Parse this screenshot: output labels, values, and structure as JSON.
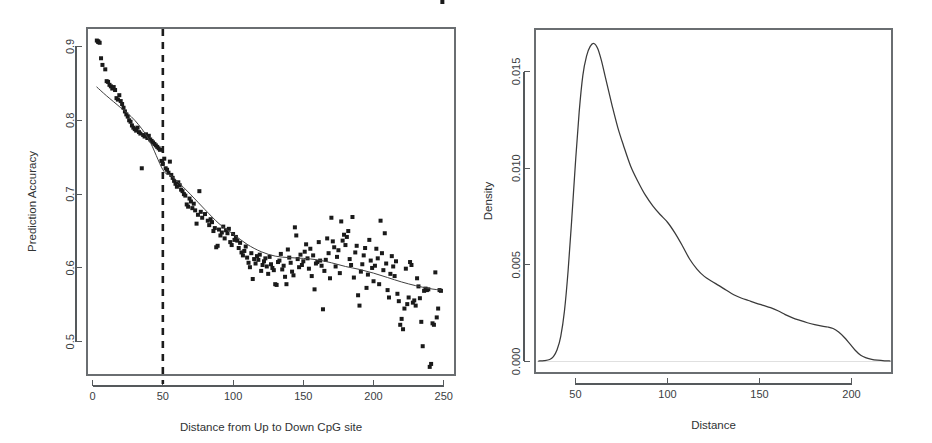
{
  "figure": {
    "background": "#ffffff",
    "point_color": "#1a1a1a",
    "line_color": "#404040",
    "axis_color": "#55595c"
  },
  "chart_data": [
    {
      "type": "scatter",
      "panel": "left",
      "title": "",
      "xlabel": "Distance from Up to Down CpG site",
      "ylabel": "Prediction Accuracy",
      "xlim": [
        -4,
        258
      ],
      "ylim": [
        0.455,
        0.925
      ],
      "xticks": [
        0,
        50,
        100,
        150,
        200,
        250
      ],
      "xticklabels": [
        "0",
        "50",
        "100",
        "150",
        "200",
        "250"
      ],
      "yticks": [
        0.5,
        0.6,
        0.7,
        0.8,
        0.9
      ],
      "yticklabels": [
        "0.5",
        "0.6",
        "0.7",
        "0.8",
        "0.9"
      ],
      "grid": false,
      "legend": null,
      "marker": "square",
      "annotations": [
        {
          "kind": "vertical-dashed-line",
          "x": 50,
          "label": ""
        }
      ],
      "x": [
        3,
        4,
        4,
        5,
        6,
        7,
        9,
        10,
        11,
        12,
        13,
        14,
        15,
        16,
        17,
        18,
        19,
        20,
        21,
        22,
        23,
        24,
        25,
        26,
        27,
        28,
        29,
        30,
        31,
        32,
        33,
        34,
        35,
        36,
        37,
        38,
        39,
        40,
        41,
        42,
        43,
        44,
        45,
        46,
        47,
        48,
        49,
        50,
        51,
        52,
        53,
        54,
        55,
        56,
        57,
        58,
        59,
        60,
        61,
        62,
        63,
        64,
        65,
        66,
        67,
        68,
        69,
        70,
        71,
        72,
        73,
        74,
        75,
        76,
        77,
        78,
        80,
        82,
        83,
        84,
        85,
        86,
        87,
        88,
        89,
        90,
        91,
        92,
        93,
        94,
        95,
        96,
        97,
        98,
        99,
        100,
        101,
        102,
        103,
        104,
        105,
        106,
        107,
        108,
        109,
        110,
        111,
        112,
        113,
        114,
        115,
        116,
        117,
        118,
        119,
        120,
        121,
        122,
        123,
        124,
        125,
        126,
        127,
        128,
        129,
        130,
        131,
        132,
        133,
        134,
        135,
        136,
        137,
        138,
        139,
        140,
        141,
        142,
        143,
        144,
        145,
        146,
        147,
        148,
        149,
        150,
        151,
        152,
        153,
        154,
        155,
        156,
        157,
        158,
        159,
        160,
        161,
        162,
        163,
        164,
        165,
        166,
        167,
        168,
        169,
        170,
        171,
        172,
        173,
        174,
        175,
        176,
        177,
        178,
        179,
        180,
        181,
        182,
        183,
        184,
        185,
        186,
        187,
        188,
        189,
        190,
        191,
        192,
        193,
        194,
        195,
        196,
        197,
        198,
        199,
        200,
        201,
        202,
        203,
        204,
        205,
        206,
        207,
        208,
        209,
        210,
        211,
        212,
        213,
        214,
        215,
        216,
        217,
        218,
        219,
        220,
        221,
        222,
        223,
        224,
        225,
        226,
        227,
        228,
        229,
        230,
        231,
        232,
        233,
        234,
        235,
        236,
        237,
        238,
        239,
        240,
        241,
        242,
        243,
        244,
        245,
        246,
        247,
        248,
        249
      ],
      "y": [
        0.908,
        0.907,
        0.906,
        0.905,
        0.884,
        0.875,
        0.869,
        0.853,
        0.852,
        0.848,
        0.846,
        0.843,
        0.845,
        0.841,
        0.83,
        0.828,
        0.834,
        0.826,
        0.822,
        0.817,
        0.812,
        0.808,
        0.805,
        0.8,
        0.798,
        0.793,
        0.79,
        0.788,
        0.786,
        0.79,
        0.784,
        0.782,
        0.735,
        0.78,
        0.778,
        0.781,
        0.776,
        0.779,
        0.774,
        0.772,
        0.77,
        0.768,
        0.766,
        0.764,
        0.762,
        0.76,
        0.745,
        0.741,
        0.748,
        0.735,
        0.733,
        0.729,
        0.744,
        0.726,
        0.722,
        0.718,
        0.714,
        0.71,
        0.716,
        0.712,
        0.706,
        0.704,
        0.7,
        0.698,
        0.686,
        0.683,
        0.694,
        0.69,
        0.681,
        0.687,
        0.678,
        0.66,
        0.672,
        0.704,
        0.676,
        0.668,
        0.673,
        0.664,
        0.658,
        0.666,
        0.662,
        0.65,
        0.654,
        0.628,
        0.63,
        0.652,
        0.644,
        0.648,
        0.656,
        0.64,
        0.651,
        0.647,
        0.653,
        0.635,
        0.631,
        0.646,
        0.638,
        0.642,
        0.637,
        0.627,
        0.634,
        0.621,
        0.617,
        0.623,
        0.629,
        0.614,
        0.607,
        0.601,
        0.62,
        0.585,
        0.612,
        0.606,
        0.616,
        0.611,
        0.618,
        0.596,
        0.604,
        0.609,
        0.613,
        0.602,
        0.592,
        0.615,
        0.605,
        0.6,
        0.597,
        0.578,
        0.577,
        0.608,
        0.61,
        0.619,
        0.598,
        0.603,
        0.588,
        0.578,
        0.625,
        0.614,
        0.607,
        0.595,
        0.59,
        0.655,
        0.644,
        0.612,
        0.601,
        0.618,
        0.604,
        0.609,
        0.622,
        0.632,
        0.613,
        0.599,
        0.626,
        0.589,
        0.617,
        0.571,
        0.606,
        0.608,
        0.635,
        0.61,
        0.603,
        0.544,
        0.596,
        0.611,
        0.64,
        0.62,
        0.586,
        0.668,
        0.636,
        0.628,
        0.602,
        0.615,
        0.624,
        0.593,
        0.663,
        0.637,
        0.645,
        0.631,
        0.642,
        0.65,
        0.612,
        0.604,
        0.669,
        0.587,
        0.621,
        0.63,
        0.563,
        0.549,
        0.595,
        0.605,
        0.617,
        0.627,
        0.573,
        0.591,
        0.638,
        0.61,
        0.6,
        0.582,
        0.603,
        0.626,
        0.613,
        0.578,
        0.664,
        0.62,
        0.597,
        0.647,
        0.606,
        0.57,
        0.56,
        0.592,
        0.616,
        0.602,
        0.589,
        0.609,
        0.565,
        0.555,
        0.523,
        0.531,
        0.517,
        0.545,
        0.599,
        0.551,
        0.56,
        0.608,
        0.604,
        0.553,
        0.556,
        0.549,
        0.586,
        0.575,
        0.559,
        0.527,
        0.494,
        0.569,
        0.572,
        0.57,
        0.571,
        0.466,
        0.47,
        0.525,
        0.523,
        0.594,
        0.533,
        0.545,
        0.57,
        0.569
      ],
      "trend_line": {
        "label": "loess fit",
        "x": [
          3,
          10,
          20,
          30,
          40,
          50,
          55,
          60,
          70,
          80,
          90,
          100,
          110,
          120,
          130,
          140,
          150,
          160,
          170,
          180,
          190,
          200,
          210,
          220,
          230,
          240,
          248
        ],
        "y": [
          0.845,
          0.833,
          0.817,
          0.8,
          0.774,
          0.733,
          0.726,
          0.718,
          0.699,
          0.679,
          0.66,
          0.646,
          0.632,
          0.622,
          0.616,
          0.614,
          0.613,
          0.611,
          0.607,
          0.602,
          0.598,
          0.593,
          0.587,
          0.581,
          0.576,
          0.572,
          0.57
        ]
      }
    },
    {
      "type": "line",
      "panel": "right",
      "title": "",
      "xlabel": "Distance",
      "ylabel": "Density",
      "xlim": [
        28,
        222
      ],
      "ylim": [
        -0.0006,
        0.0172
      ],
      "xticks": [
        50,
        100,
        150,
        200
      ],
      "xticklabels": [
        "50",
        "100",
        "150",
        "200"
      ],
      "yticks": [
        0.0,
        0.005,
        0.01,
        0.015
      ],
      "yticklabels": [
        "0.000",
        "0.005",
        "0.010",
        "0.015"
      ],
      "grid": false,
      "legend": null,
      "series": [
        {
          "name": "Density",
          "x": [
            30,
            33,
            36,
            38,
            40,
            42,
            44,
            46,
            48,
            50,
            52,
            54,
            56,
            58,
            60,
            62,
            64,
            66,
            68,
            70,
            73,
            76,
            80,
            84,
            88,
            92,
            96,
            100,
            104,
            108,
            112,
            116,
            120,
            124,
            128,
            132,
            136,
            140,
            144,
            148,
            152,
            156,
            160,
            164,
            168,
            172,
            176,
            180,
            184,
            187,
            190,
            193,
            196,
            199,
            202,
            205,
            208,
            211,
            214,
            218,
            221
          ],
          "y": [
            2e-05,
            4e-05,
            0.0001,
            0.00025,
            0.0006,
            0.0013,
            0.0026,
            0.0047,
            0.0074,
            0.0103,
            0.0129,
            0.0148,
            0.0158,
            0.0163,
            0.01645,
            0.0162,
            0.0156,
            0.0148,
            0.014,
            0.0132,
            0.0121,
            0.0112,
            0.0101,
            0.0093,
            0.0086,
            0.00805,
            0.0076,
            0.0072,
            0.00665,
            0.006,
            0.0053,
            0.00478,
            0.0044,
            0.00415,
            0.00392,
            0.00368,
            0.00345,
            0.00328,
            0.00315,
            0.00302,
            0.0029,
            0.00278,
            0.00262,
            0.00242,
            0.00225,
            0.00212,
            0.002,
            0.0019,
            0.00182,
            0.00178,
            0.0017,
            0.00152,
            0.00125,
            0.00092,
            0.00058,
            0.00032,
            0.00018,
            0.0001,
            6e-05,
            3e-05,
            2e-05
          ]
        }
      ]
    }
  ]
}
